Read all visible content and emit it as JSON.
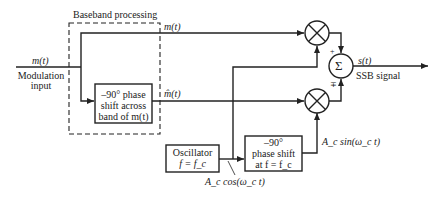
{
  "diagram": {
    "type": "block-diagram",
    "baseband_group": {
      "label": "Baseband processing"
    },
    "input": {
      "signal": "m(t)",
      "label_line1": "Modulation",
      "label_line2": "input"
    },
    "upper_path": {
      "signal": "m(t)"
    },
    "lower_path": {
      "signal": "m̂(t)"
    },
    "hilbert_block": {
      "line1": "–90° phase",
      "line2": "shift across",
      "line3": "band of m(t)"
    },
    "oscillator_block": {
      "line1": "Oscillator",
      "line2": "f = f_c"
    },
    "carrier_phase_block": {
      "line1": "–90°",
      "line2": "phase shift",
      "line3": "at f = f_c"
    },
    "cos_carrier": "A_c cos(ω_c t)",
    "sin_carrier": "A_c sin(ω_c t)",
    "summer": {
      "symbol": "Σ",
      "top_sign": "+",
      "bottom_sign": "∓"
    },
    "output": {
      "signal": "s(t)",
      "label": "SSB signal"
    },
    "multipliers": [
      {
        "symbol": "⊗",
        "position": "upper"
      },
      {
        "symbol": "⊗",
        "position": "lower"
      }
    ],
    "colors": {
      "line": "#222222",
      "background": "#ffffff"
    }
  }
}
